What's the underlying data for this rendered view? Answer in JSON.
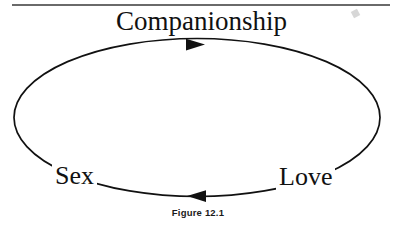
{
  "figure": {
    "caption": "Figure 12.1",
    "nodes": [
      {
        "id": "companionship",
        "label": "Companionship",
        "position": "top"
      },
      {
        "id": "love",
        "label": "Love",
        "position": "bottom-right"
      },
      {
        "id": "sex",
        "label": "Sex",
        "position": "bottom-left"
      }
    ],
    "arrows": [
      {
        "id": "top-arrow",
        "direction": "right",
        "from": "sex",
        "to": "companionship"
      },
      {
        "id": "bottom-arrow",
        "direction": "left",
        "from": "love",
        "to": "sex"
      }
    ],
    "colors": {
      "stroke": "#111111",
      "text": "#111111",
      "background": "#ffffff",
      "scan_rule": "#5d5d5d"
    }
  }
}
